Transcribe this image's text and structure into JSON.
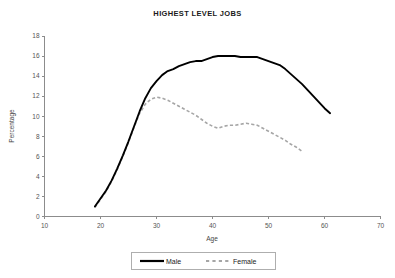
{
  "chart_data": {
    "type": "line",
    "title": "HIGHEST LEVEL JOBS",
    "xlabel": "Age",
    "ylabel": "Percentage",
    "xlim": [
      10,
      70
    ],
    "ylim": [
      0,
      18
    ],
    "xticks": [
      10,
      20,
      30,
      40,
      50,
      60,
      70
    ],
    "yticks": [
      0,
      2,
      4,
      6,
      8,
      10,
      12,
      14,
      16,
      18
    ],
    "grid": false,
    "legend_position": "bottom",
    "series": [
      {
        "name": "Male",
        "style": "solid",
        "color": "#000000",
        "x": [
          19,
          20,
          21,
          22,
          23,
          24,
          25,
          26,
          27,
          28,
          29,
          30,
          31,
          32,
          33,
          34,
          35,
          36,
          37,
          38,
          39,
          40,
          41,
          42,
          43,
          44,
          45,
          46,
          47,
          48,
          49,
          50,
          51,
          52,
          53,
          54,
          55,
          56,
          57,
          58,
          59,
          60,
          61
        ],
        "values": [
          1.0,
          1.8,
          2.6,
          3.6,
          4.8,
          6.1,
          7.5,
          9.0,
          10.5,
          11.8,
          12.8,
          13.5,
          14.1,
          14.5,
          14.7,
          15.0,
          15.2,
          15.4,
          15.5,
          15.5,
          15.7,
          15.9,
          16.0,
          16.0,
          16.0,
          16.0,
          15.9,
          15.9,
          15.9,
          15.9,
          15.7,
          15.5,
          15.3,
          15.1,
          14.7,
          14.2,
          13.7,
          13.2,
          12.6,
          12.0,
          11.4,
          10.8,
          10.3
        ]
      },
      {
        "name": "Female",
        "style": "dashed",
        "color": "#a6a6a6",
        "x": [
          19,
          20,
          21,
          22,
          23,
          24,
          25,
          26,
          27,
          28,
          29,
          30,
          31,
          32,
          33,
          34,
          35,
          36,
          37,
          38,
          39,
          40,
          41,
          42,
          43,
          44,
          45,
          46,
          47,
          48,
          49,
          50,
          51,
          52,
          53,
          54,
          55,
          56
        ],
        "values": [
          0.9,
          1.7,
          2.5,
          3.5,
          4.7,
          6.0,
          7.4,
          8.9,
          10.3,
          11.2,
          11.7,
          11.9,
          11.8,
          11.6,
          11.3,
          11.0,
          10.7,
          10.4,
          10.1,
          9.7,
          9.3,
          9.0,
          8.8,
          9.0,
          9.1,
          9.1,
          9.2,
          9.3,
          9.2,
          9.1,
          8.8,
          8.5,
          8.2,
          7.9,
          7.6,
          7.2,
          6.9,
          6.5
        ]
      }
    ]
  },
  "legend": {
    "entries": [
      {
        "label": "Male"
      },
      {
        "label": "Female"
      }
    ]
  }
}
